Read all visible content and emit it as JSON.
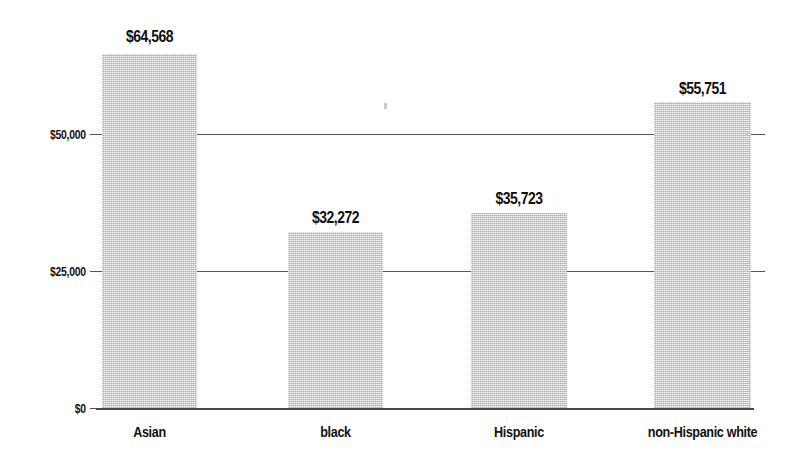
{
  "chart_data": {
    "type": "bar",
    "title": "",
    "subtitle": "",
    "xlabel": "",
    "ylabel": "",
    "categories": [
      "Asian",
      "black",
      "Hispanic",
      "non-Hispanic white"
    ],
    "values": [
      64568,
      32272,
      35723,
      55751
    ],
    "value_labels": [
      "$64,568",
      "$32,272",
      "$35,723",
      "$55,751"
    ],
    "ylim": [
      0,
      75000
    ],
    "yticks": [
      0,
      25000,
      50000
    ],
    "ytick_labels": [
      "$0",
      "$25,000",
      "$50,000"
    ],
    "grid": true,
    "legend": false,
    "legend_position": "none",
    "bar_color": "#c9c9c9",
    "axis_color": "#4a4a4a",
    "text_color": "#111111"
  },
  "axis": {
    "y_ticks": [
      {
        "label": "$0",
        "value": 0
      },
      {
        "label": "$25,000",
        "value": 25000
      },
      {
        "label": "$50,000",
        "value": 50000
      }
    ]
  },
  "bars": [
    {
      "category": "Asian",
      "value": 64568,
      "label": "$64,568"
    },
    {
      "category": "black",
      "value": 32272,
      "label": "$32,272"
    },
    {
      "category": "Hispanic",
      "value": 35723,
      "label": "$35,723"
    },
    {
      "category": "non-Hispanic white",
      "value": 55751,
      "label": "$55,751"
    }
  ]
}
